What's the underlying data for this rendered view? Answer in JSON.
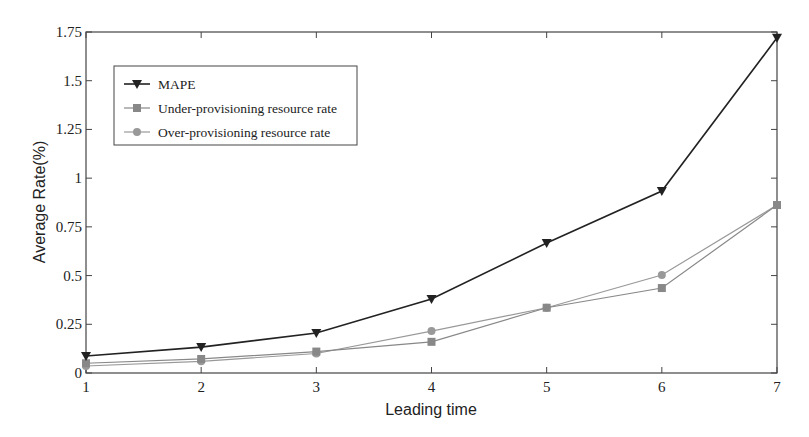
{
  "chart_data": {
    "type": "line",
    "title": "",
    "xlabel": "Leading time",
    "ylabel": "Average Rate(%)",
    "x": [
      1,
      2,
      3,
      4,
      5,
      6,
      7
    ],
    "xlim": [
      1,
      7
    ],
    "ylim": [
      0,
      1.75
    ],
    "xticks": [
      "1",
      "2",
      "3",
      "4",
      "5",
      "6",
      "7"
    ],
    "yticks": [
      "0",
      "0.25",
      "0.5",
      "0.75",
      "1",
      "1.25",
      "1.5",
      "1.75"
    ],
    "grid": false,
    "legend_position": "upper left",
    "series": [
      {
        "name": "MAPE",
        "marker": "triangle-down",
        "color": "#222222",
        "values": [
          0.087,
          0.133,
          0.205,
          0.38,
          0.667,
          0.934,
          1.72
        ]
      },
      {
        "name": "Under-provisioning resource rate",
        "marker": "square",
        "color": "#888888",
        "values": [
          0.05,
          0.072,
          0.11,
          0.16,
          0.335,
          0.436,
          0.862
        ]
      },
      {
        "name": "Over-provisioning resource rate",
        "marker": "circle",
        "color": "#999999",
        "values": [
          0.036,
          0.06,
          0.1,
          0.215,
          0.335,
          0.503,
          0.862
        ]
      }
    ]
  }
}
